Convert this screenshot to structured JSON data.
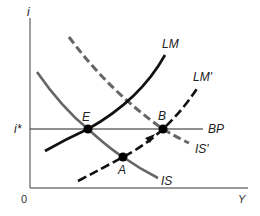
{
  "diagram": {
    "type": "IS-LM-BP",
    "axes": {
      "y_label": "i",
      "x_label": "Y",
      "origin_label": "0",
      "interest_level_label": "i*"
    },
    "curves": [
      {
        "id": "is",
        "label": "IS",
        "style": "solid",
        "color": "#666666"
      },
      {
        "id": "is-prime",
        "label": "IS'",
        "style": "dashed",
        "color": "#666666"
      },
      {
        "id": "lm",
        "label": "LM",
        "style": "solid",
        "color": "#111111"
      },
      {
        "id": "lm-prime",
        "label": "LM'",
        "style": "dashed",
        "color": "#111111"
      },
      {
        "id": "bp",
        "label": "BP",
        "style": "solid",
        "color": "#222222"
      }
    ],
    "points": [
      {
        "id": "E",
        "label": "E"
      },
      {
        "id": "A",
        "label": "A"
      },
      {
        "id": "B",
        "label": "B"
      }
    ],
    "arrow": {
      "from": "A",
      "to": "B",
      "along": "LM'"
    }
  },
  "colors": {
    "axis": "#777777",
    "is": "#666666",
    "lm": "#111111",
    "bp": "#222222",
    "point": "#000000"
  }
}
